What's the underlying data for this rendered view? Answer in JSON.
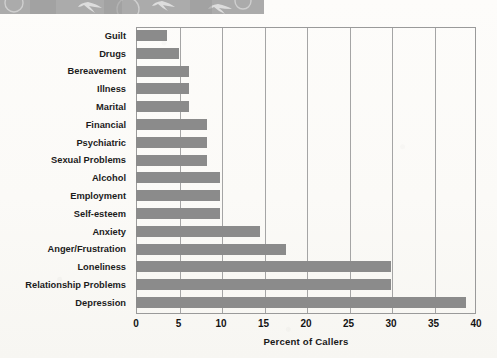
{
  "header_band": {
    "icon": "decorative-band",
    "shapes": [
      "circle-outline",
      "bird-swoosh",
      "circle-outline",
      "bird-swoosh",
      "bird-swoosh"
    ],
    "color": "#ababab"
  },
  "chart_data": {
    "type": "bar",
    "orientation": "horizontal",
    "title": "",
    "xlabel": "Percent of Callers",
    "ylabel": "",
    "xlim": [
      0,
      40
    ],
    "xticks": [
      0,
      5,
      10,
      15,
      20,
      25,
      30,
      35,
      40
    ],
    "grid": true,
    "legend": false,
    "bar_color": "#8b8b8b",
    "categories": [
      "Guilt",
      "Drugs",
      "Bereavement",
      "Illness",
      "Marital",
      "Financial",
      "Psychiatric",
      "Sexual Problems",
      "Alcohol",
      "Employment",
      "Self-esteem",
      "Anxiety",
      "Anger/Frustration",
      "Loneliness",
      "Relationship Problems",
      "Depression"
    ],
    "values": [
      3.7,
      5.0,
      6.2,
      6.2,
      6.2,
      8.3,
      8.3,
      8.3,
      9.9,
      9.9,
      9.9,
      14.6,
      17.7,
      30.0,
      30.0,
      38.8
    ]
  }
}
